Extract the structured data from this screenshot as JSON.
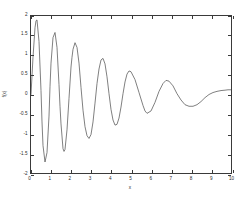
{
  "chart_data": {
    "type": "line",
    "title": "",
    "xlabel": "x",
    "ylabel": "f(x)",
    "xlim": [
      0,
      10
    ],
    "ylim": [
      -2,
      2
    ],
    "grid": false,
    "legend": null,
    "xticks": [
      "0",
      "1",
      "2",
      "3",
      "4",
      "5",
      "6",
      "7",
      "8",
      "9",
      "10"
    ],
    "xtick_values": [
      0,
      1,
      2,
      3,
      4,
      5,
      6,
      7,
      8,
      9,
      10
    ],
    "yticks": [
      "2",
      "1.5",
      "1",
      "0.5",
      "0",
      "-0.5",
      "-1",
      "-1.5",
      "-2"
    ],
    "ytick_values": [
      2,
      1.5,
      1,
      0.5,
      0,
      -0.5,
      -1,
      -1.5,
      -2
    ],
    "line_color": "#555555",
    "series": [
      {
        "name": "f(x)",
        "description": "damped oscillation, decaying amplitude from about 1.9 to 0.35, period about 1.65, settling near 0.1",
        "x": [
          0.0,
          0.1,
          0.2,
          0.25,
          0.3,
          0.4,
          0.5,
          0.55,
          0.6,
          0.7,
          0.8,
          0.9,
          0.95,
          1.0,
          1.1,
          1.2,
          1.3,
          1.4,
          1.45,
          1.5,
          1.6,
          1.65,
          1.7,
          1.8,
          1.9,
          2.0,
          2.05,
          2.1,
          2.2,
          2.3,
          2.4,
          2.5,
          2.6,
          2.7,
          2.8,
          2.9,
          3.0,
          3.1,
          3.2,
          3.3,
          3.4,
          3.5,
          3.6,
          3.7,
          3.8,
          3.9,
          4.0,
          4.1,
          4.2,
          4.3,
          4.4,
          4.5,
          4.6,
          4.7,
          4.8,
          4.9,
          5.0,
          5.2,
          5.4,
          5.6,
          5.7,
          5.8,
          6.0,
          6.2,
          6.4,
          6.6,
          6.75,
          6.9,
          7.1,
          7.3,
          7.5,
          7.7,
          7.9,
          8.1,
          8.3,
          8.5,
          8.7,
          8.9,
          9.1,
          9.3,
          9.5,
          9.7,
          9.85,
          10.0
        ],
        "y": [
          0.0,
          0.95,
          1.7,
          1.88,
          1.9,
          1.35,
          0.1,
          -0.7,
          -1.3,
          -1.72,
          -1.48,
          -0.55,
          0.2,
          0.8,
          1.45,
          1.58,
          1.2,
          0.25,
          -0.3,
          -0.75,
          -1.38,
          -1.45,
          -1.4,
          -0.9,
          -0.1,
          0.7,
          0.95,
          1.15,
          1.32,
          1.2,
          0.8,
          0.18,
          -0.4,
          -0.82,
          -1.05,
          -1.12,
          -1.02,
          -0.7,
          -0.22,
          0.28,
          0.65,
          0.88,
          0.92,
          0.78,
          0.45,
          0.02,
          -0.38,
          -0.65,
          -0.78,
          -0.76,
          -0.6,
          -0.32,
          0.02,
          0.32,
          0.52,
          0.6,
          0.58,
          0.38,
          0.05,
          -0.28,
          -0.42,
          -0.48,
          -0.42,
          -0.2,
          0.08,
          0.28,
          0.36,
          0.34,
          0.22,
          0.02,
          -0.14,
          -0.26,
          -0.3,
          -0.3,
          -0.26,
          -0.18,
          -0.08,
          0.0,
          0.05,
          0.08,
          0.1,
          0.11,
          0.12,
          0.12
        ]
      }
    ]
  },
  "axes": {
    "x_label": "x",
    "y_label": "f(x)"
  }
}
